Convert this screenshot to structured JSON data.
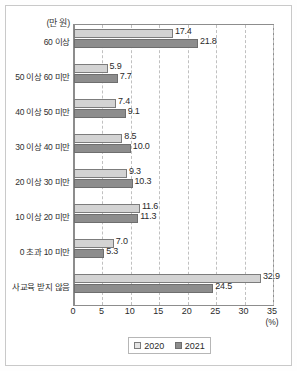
{
  "chart_data": {
    "type": "bar",
    "orientation": "horizontal",
    "title": "",
    "unit_label": "(만 원)",
    "xlabel": "(%)",
    "ylabel": "",
    "xlim": [
      0,
      35
    ],
    "xticks": [
      0,
      5,
      10,
      15,
      20,
      25,
      30,
      35
    ],
    "xtick_labels": [
      "0",
      "5",
      "10",
      "15",
      "20",
      "25",
      "30",
      "35"
    ],
    "grid": true,
    "legend_position": "bottom",
    "categories": [
      "60 이상",
      "50 이상 60 미만",
      "40 이상 50 미만",
      "30 이상 40 미만",
      "20 이상 30 미만",
      "10 이상 20 미만",
      "0 초과 10 미만",
      "사교육 받지 않음"
    ],
    "series": [
      {
        "name": "2020",
        "color": "#d3d3d3",
        "values": [
          17.4,
          5.9,
          7.4,
          8.5,
          9.3,
          11.6,
          7.0,
          32.9
        ],
        "labels": [
          "17.4",
          "5.9",
          "7.4",
          "8.5",
          "9.3",
          "11.6",
          "7.0",
          "32.9"
        ]
      },
      {
        "name": "2021",
        "color": "#8d8d8d",
        "values": [
          21.8,
          7.7,
          9.1,
          10.0,
          10.3,
          11.3,
          5.3,
          24.5
        ],
        "labels": [
          "21.8",
          "7.7",
          "9.1",
          "10.0",
          "10.3",
          "11.3",
          "5.3",
          "24.5"
        ]
      }
    ]
  },
  "legend": {
    "items": [
      {
        "label": "2020"
      },
      {
        "label": "2021"
      }
    ]
  }
}
